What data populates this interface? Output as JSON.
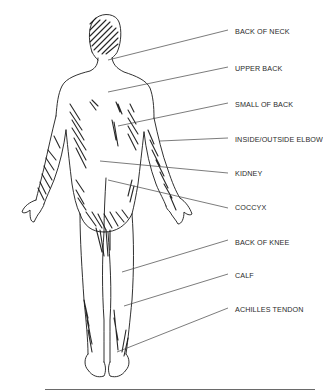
{
  "diagram": {
    "view": "posterior human figure",
    "labels": [
      {
        "id": "back-of-neck",
        "text": "BACK OF NECK",
        "y": 31,
        "line": [
          228,
          30,
          108,
          60
        ]
      },
      {
        "id": "upper-back",
        "text": "UPPER BACK",
        "y": 68,
        "line": [
          228,
          67,
          108,
          92
        ]
      },
      {
        "id": "small-of-back",
        "text": "SMALL OF BACK",
        "y": 104,
        "line": [
          228,
          103,
          118,
          126
        ]
      },
      {
        "id": "inside-outside-elbow",
        "text": "INSIDE/OUTSIDE ELBOW",
        "y": 139,
        "line": [
          228,
          138,
          160,
          141
        ]
      },
      {
        "id": "kidney",
        "text": "KIDNEY",
        "y": 173,
        "line": [
          228,
          173,
          100,
          161
        ]
      },
      {
        "id": "coccyx",
        "text": "COCCYX",
        "y": 207,
        "line": [
          228,
          208,
          108,
          180
        ]
      },
      {
        "id": "back-of-knee",
        "text": "BACK OF KNEE",
        "y": 242,
        "line": [
          228,
          240,
          122,
          272
        ]
      },
      {
        "id": "calf",
        "text": "CALF",
        "y": 275,
        "line": [
          228,
          274,
          124,
          306
        ]
      },
      {
        "id": "achilles-tendon",
        "text": "ACHILLES TENDON",
        "y": 309,
        "line": [
          228,
          308,
          117,
          352
        ]
      }
    ],
    "colors": {
      "ink": "#1a1a1a",
      "leader": "#444444",
      "text": "#2a2a2a",
      "rule": "#6a6a6a"
    }
  }
}
